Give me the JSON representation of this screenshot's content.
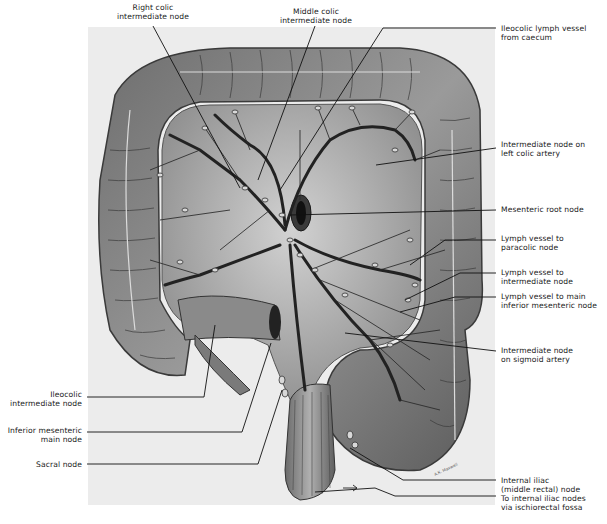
{
  "figure": {
    "signature": "A.K. Maxwell",
    "colors": {
      "background": "#ffffff",
      "panel": "#ececec",
      "bowel_dark": "#5a5a5a",
      "bowel_mid": "#8c8c8c",
      "mesentery": "#b8b8b8",
      "vessel": "#262626",
      "node": "#d8d8d8",
      "leader": "#111111"
    }
  },
  "labels": {
    "top": [
      {
        "id": "right-colic",
        "lines": [
          "Right colic",
          "intermediate node"
        ]
      },
      {
        "id": "middle-colic",
        "lines": [
          "Middle colic",
          "intermediate node"
        ]
      }
    ],
    "right": [
      {
        "id": "ileocolic-vessel",
        "lines": [
          "Ileocolic lymph vessel",
          "from caecum"
        ]
      },
      {
        "id": "left-colic",
        "lines": [
          "Intermediate node on",
          "left colic artery"
        ]
      },
      {
        "id": "mesenteric-root",
        "lines": [
          "Mesenteric root node"
        ]
      },
      {
        "id": "paracolic",
        "lines": [
          "Lymph vessel to",
          "paracolic node"
        ]
      },
      {
        "id": "intermediate",
        "lines": [
          "Lymph vessel to",
          "intermediate node"
        ]
      },
      {
        "id": "main-inferior",
        "lines": [
          "Lymph vessel to main",
          "inferior mesenteric node"
        ]
      },
      {
        "id": "sigmoid",
        "lines": [
          "Intermediate node",
          "on sigmoid artery"
        ]
      },
      {
        "id": "internal-iliac",
        "lines": [
          "Internal iliac",
          "(middle rectal) node"
        ]
      },
      {
        "id": "ischiorectal",
        "lines": [
          "To internal iliac nodes",
          "via ischiorectal fossa"
        ]
      }
    ],
    "left": [
      {
        "id": "ileocolic-node",
        "lines": [
          "Ileocolic",
          "intermediate node"
        ]
      },
      {
        "id": "inferior-mesenteric",
        "lines": [
          "Inferior mesenteric",
          "main node"
        ]
      },
      {
        "id": "sacral",
        "lines": [
          "Sacral node"
        ]
      }
    ]
  }
}
